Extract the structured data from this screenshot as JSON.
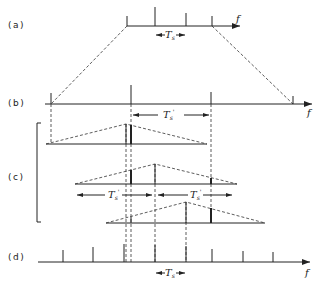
{
  "panels": {
    "a": {
      "label": "(a)",
      "axis_label": "f",
      "spacing_label": "T",
      "spacing_sub": "s",
      "spacing_prime": ""
    },
    "b": {
      "label": "(b)",
      "axis_label": "f",
      "spacing_label": "T",
      "spacing_sub": "s",
      "spacing_prime": "'"
    },
    "c": {
      "label": "(c)",
      "spacing_left_label": "T",
      "spacing_left_sub": "s",
      "spacing_left_prime": "'",
      "spacing_right_label": "T",
      "spacing_right_sub": "s",
      "spacing_right_prime": "'"
    },
    "d": {
      "label": "(d)",
      "axis_label": "f",
      "spacing_label": "T",
      "spacing_sub": "s"
    }
  }
}
